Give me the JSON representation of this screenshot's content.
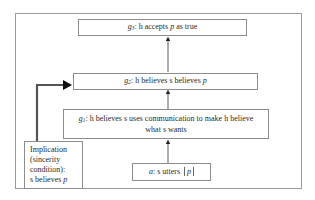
{
  "diagram": {
    "type": "flow",
    "nodes": [
      {
        "id": "g3",
        "label_prefix": "g",
        "label_sub": "3",
        "text_before": ": h accepts ",
        "var": "p",
        "text_after": " as true"
      },
      {
        "id": "g2",
        "label_prefix": "g",
        "label_sub": "2",
        "text_before": ": h believes s believes ",
        "var": "p",
        "text_after": ""
      },
      {
        "id": "g1",
        "label_prefix": "g",
        "label_sub": "1",
        "text_before": ": h believes s uses communication to make h believe what s wants",
        "var": "",
        "text_after": ""
      },
      {
        "id": "a",
        "label_prefix": "a",
        "label_sub": "",
        "text_before": ": s utters ",
        "var": "p",
        "text_after": ""
      },
      {
        "id": "impl",
        "lines": [
          "Implication",
          "(sincerity",
          "condition):",
          "s believes "
        ],
        "var": "p"
      }
    ],
    "edges": [
      {
        "from": "a",
        "to": "g1"
      },
      {
        "from": "g1",
        "to": "g2"
      },
      {
        "from": "g2",
        "to": "g3"
      },
      {
        "from": "impl",
        "to": "g2",
        "style": "thick"
      }
    ],
    "colors": {
      "border": "#8c8c8c",
      "arrow": "#333333",
      "thick_arrow": "#555555"
    }
  }
}
